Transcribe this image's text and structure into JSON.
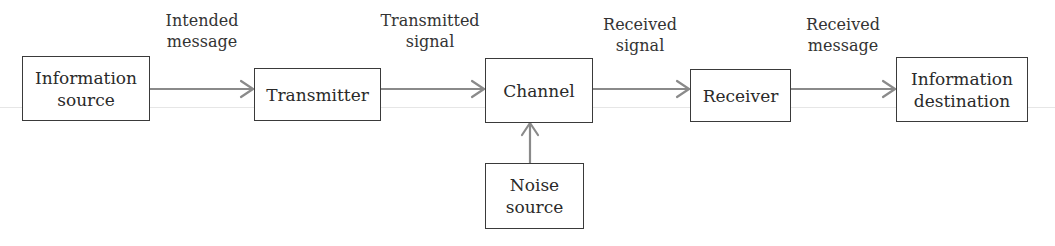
{
  "diagram": {
    "type": "block-flow",
    "blocks": [
      {
        "id": "information-source",
        "lines": [
          "Information",
          "source"
        ]
      },
      {
        "id": "transmitter",
        "lines": [
          "Transmitter"
        ]
      },
      {
        "id": "channel",
        "lines": [
          "Channel"
        ]
      },
      {
        "id": "receiver",
        "lines": [
          "Receiver"
        ]
      },
      {
        "id": "information-destination",
        "lines": [
          "Information",
          "destination"
        ]
      },
      {
        "id": "noise-source",
        "lines": [
          "Noise",
          "source"
        ]
      }
    ],
    "edges": [
      {
        "from": "information-source",
        "to": "transmitter",
        "label": [
          "Intended",
          "message"
        ]
      },
      {
        "from": "transmitter",
        "to": "channel",
        "label": [
          "Transmitted",
          "signal"
        ]
      },
      {
        "from": "channel",
        "to": "receiver",
        "label": [
          "Received",
          "signal"
        ]
      },
      {
        "from": "receiver",
        "to": "information-destination",
        "label": [
          "Received",
          "message"
        ]
      },
      {
        "from": "noise-source",
        "to": "channel",
        "label": []
      }
    ],
    "colors": {
      "box_border": "#3a3a3a",
      "arrow": "#8a8a8a",
      "text": "#2a2a2a"
    }
  }
}
